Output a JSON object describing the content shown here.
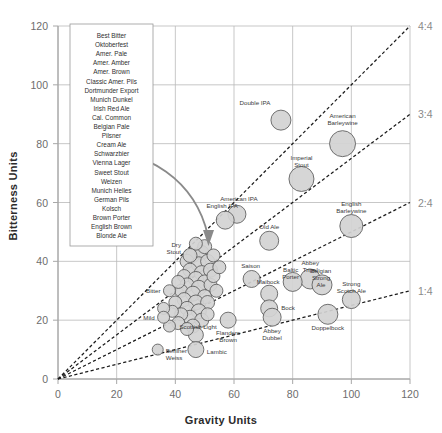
{
  "chart_data": {
    "type": "scatter",
    "title": "",
    "xlabel": "Gravity Units",
    "ylabel": "Bitterness Units",
    "xlim": [
      0,
      120
    ],
    "ylim": [
      0,
      120
    ],
    "xticks": [
      0,
      20,
      40,
      60,
      80,
      100,
      120
    ],
    "yticks": [
      0,
      20,
      40,
      60,
      80,
      100,
      120
    ],
    "grid": true,
    "legend_position": "top-left-inset",
    "ratio_lines": [
      {
        "label": "4:4",
        "slope": 1.0
      },
      {
        "label": "3:4",
        "slope": 0.75
      },
      {
        "label": "2:4",
        "slope": 0.5
      },
      {
        "label": "1:4",
        "slope": 0.25
      }
    ],
    "annotation_arrow": {
      "from_label": "legend-box",
      "to_label": "central-cluster",
      "description": "curved arrow from style list to dense cluster"
    },
    "points": [
      {
        "label": "Double IPA",
        "x": 76,
        "y": 88,
        "r": 10
      },
      {
        "label": "American Barleywine",
        "x": 97,
        "y": 80,
        "r": 13
      },
      {
        "label": "Imperial Stout",
        "x": 83,
        "y": 68,
        "r": 12.5
      },
      {
        "label": "English Barleywine",
        "x": 100,
        "y": 52,
        "r": 11.5
      },
      {
        "label": "American IPA",
        "x": 61,
        "y": 56,
        "r": 9
      },
      {
        "label": "English IPA",
        "x": 57,
        "y": 54,
        "r": 9
      },
      {
        "label": "Old Ale",
        "x": 72,
        "y": 47,
        "r": 9.5
      },
      {
        "label": "Abbey Tripel",
        "x": 86,
        "y": 34,
        "r": 10
      },
      {
        "label": "Belgian Strong Ale",
        "x": 90,
        "y": 32,
        "r": 10
      },
      {
        "label": "Strong Scotch Ale",
        "x": 100,
        "y": 27,
        "r": 9
      },
      {
        "label": "Baltic Porter",
        "x": 80,
        "y": 33,
        "r": 9.5
      },
      {
        "label": "Saison",
        "x": 66,
        "y": 34,
        "r": 8.5
      },
      {
        "label": "Maibock",
        "x": 72,
        "y": 29,
        "r": 8.5
      },
      {
        "label": "Bock",
        "x": 72,
        "y": 24,
        "r": 8.5
      },
      {
        "label": "Doppelbock",
        "x": 92,
        "y": 22,
        "r": 10
      },
      {
        "label": "Abbey Dubbel",
        "x": 73,
        "y": 21,
        "r": 9
      },
      {
        "label": "Flanders Brown",
        "x": 58,
        "y": 20,
        "r": 8
      },
      {
        "label": "Lambic",
        "x": 47,
        "y": 10,
        "r": 8
      },
      {
        "label": "Berliner Weiss",
        "x": 34,
        "y": 10,
        "r": 5.5
      },
      {
        "label": "Scottish Light",
        "x": 38,
        "y": 18,
        "r": 6
      },
      {
        "label": "Mild",
        "x": 36,
        "y": 21,
        "r": 6
      },
      {
        "label": "Bitter",
        "x": 38,
        "y": 30,
        "r": 6
      },
      {
        "label": "Dry Stout",
        "x": 45,
        "y": 42,
        "r": 7
      }
    ],
    "cluster_points": [
      {
        "x": 46,
        "y": 42,
        "r": 7
      },
      {
        "x": 49,
        "y": 43,
        "r": 7
      },
      {
        "x": 44,
        "y": 40,
        "r": 7
      },
      {
        "x": 48,
        "y": 39,
        "r": 7.5
      },
      {
        "x": 51,
        "y": 40,
        "r": 7
      },
      {
        "x": 45,
        "y": 37,
        "r": 7
      },
      {
        "x": 49,
        "y": 36,
        "r": 7.5
      },
      {
        "x": 52,
        "y": 37,
        "r": 7
      },
      {
        "x": 43,
        "y": 35,
        "r": 6.5
      },
      {
        "x": 47,
        "y": 34,
        "r": 7.5
      },
      {
        "x": 50,
        "y": 33,
        "r": 7
      },
      {
        "x": 44,
        "y": 32,
        "r": 7
      },
      {
        "x": 48,
        "y": 31,
        "r": 7.5
      },
      {
        "x": 52,
        "y": 32,
        "r": 6.5
      },
      {
        "x": 42,
        "y": 30,
        "r": 6.5
      },
      {
        "x": 46,
        "y": 29,
        "r": 7.5
      },
      {
        "x": 50,
        "y": 28,
        "r": 7
      },
      {
        "x": 43,
        "y": 27,
        "r": 7
      },
      {
        "x": 47,
        "y": 26,
        "r": 7.5
      },
      {
        "x": 51,
        "y": 26,
        "r": 7
      },
      {
        "x": 44,
        "y": 24,
        "r": 7
      },
      {
        "x": 48,
        "y": 23,
        "r": 7.5
      },
      {
        "x": 45,
        "y": 21,
        "r": 7
      },
      {
        "x": 49,
        "y": 20,
        "r": 7
      },
      {
        "x": 46,
        "y": 18,
        "r": 7
      },
      {
        "x": 47,
        "y": 15,
        "r": 7.5
      },
      {
        "x": 53,
        "y": 35,
        "r": 6.5
      },
      {
        "x": 41,
        "y": 33,
        "r": 6.5
      },
      {
        "x": 54,
        "y": 30,
        "r": 6.5
      },
      {
        "x": 40,
        "y": 26,
        "r": 6.5
      },
      {
        "x": 42,
        "y": 22,
        "r": 6.5
      },
      {
        "x": 51,
        "y": 22,
        "r": 6.5
      },
      {
        "x": 50,
        "y": 45,
        "r": 7
      },
      {
        "x": 47,
        "y": 46,
        "r": 6.5
      },
      {
        "x": 53,
        "y": 42,
        "r": 6.5
      },
      {
        "x": 55,
        "y": 38,
        "r": 6.5
      },
      {
        "x": 39,
        "y": 23,
        "r": 6
      },
      {
        "x": 41,
        "y": 19,
        "r": 6.5
      },
      {
        "x": 44,
        "y": 17,
        "r": 6.5
      },
      {
        "x": 36,
        "y": 24,
        "r": 6
      }
    ],
    "legend_styles": [
      "Best Bitter",
      "Oktoberfest",
      "Amer. Pale",
      "Amer. Amber",
      "Amer. Brown",
      "Classic Amer. Pils",
      "Dortmunder Export",
      "Munich Dunkel",
      "Irish Red Ale",
      "Cal. Common",
      "Belgian Pale",
      "Pilsner",
      "Cream Ale",
      "Schwarzbier",
      "Vienna Lager",
      "Sweet Stout",
      "Weizen",
      "Munich Helles",
      "German Pils",
      "Kolsch",
      "Brown Porter",
      "English Brown",
      "Blonde Ale"
    ]
  },
  "colors": {
    "bubble_fill": "#d2d2d2",
    "bubble_stroke": "#5a5a5a",
    "grid": "#b9b9b9",
    "axis": "#a8a8a8",
    "ratio_line": "#1c1c1c",
    "arrow": "#8a8a8a",
    "tick_text": "#6d6d6d",
    "axis_title": "#2b2b2b"
  }
}
